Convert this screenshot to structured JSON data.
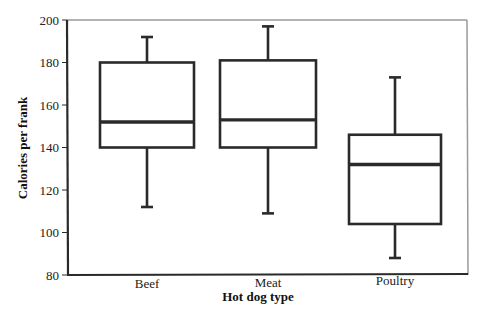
{
  "chart_data": {
    "type": "boxplot",
    "title": "",
    "xlabel": "Hot dog type",
    "ylabel": "Calories per frank",
    "ylim": [
      80,
      200
    ],
    "yticks": [
      80,
      100,
      120,
      140,
      160,
      180,
      200
    ],
    "grid": false,
    "legend": null,
    "categories": [
      "Beef",
      "Meat",
      "Poultry"
    ],
    "series": [
      {
        "name": "Beef",
        "whisker_low": 112,
        "q1": 140,
        "median": 152,
        "q3": 180,
        "whisker_high": 192
      },
      {
        "name": "Meat",
        "whisker_low": 109,
        "q1": 140,
        "median": 153,
        "q3": 181,
        "whisker_high": 197
      },
      {
        "name": "Poultry",
        "whisker_low": 88,
        "q1": 104,
        "median": 132,
        "q3": 146,
        "whisker_high": 173
      }
    ]
  },
  "colors": {
    "line": "#2a2a2a",
    "frame": "#9a9a9a",
    "background": "#ffffff"
  }
}
